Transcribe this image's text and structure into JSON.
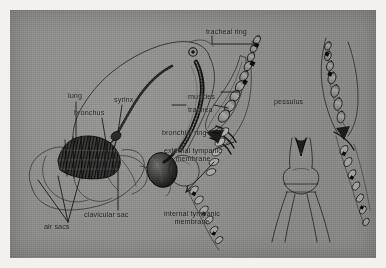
{
  "plate": {
    "background_color": "#8e8e8c",
    "page_color": "#f2f1ee",
    "ink_color": "#19191a",
    "title": "Avian respiratory tract and syrinx"
  },
  "labels": [
    {
      "id": "tracheal-ring",
      "text": "tracheal ring",
      "x": 196,
      "y": 18,
      "align": "left"
    },
    {
      "id": "lung",
      "text": "lung",
      "x": 58,
      "y": 82,
      "align": "left"
    },
    {
      "id": "syrinx",
      "text": "syrinx",
      "x": 104,
      "y": 86,
      "align": "left"
    },
    {
      "id": "bronchus",
      "text": "bronchus",
      "x": 64,
      "y": 99,
      "align": "left"
    },
    {
      "id": "muscles",
      "text": "muscles",
      "x": 178,
      "y": 83,
      "align": "left"
    },
    {
      "id": "trachea",
      "text": "trachea",
      "x": 178,
      "y": 96,
      "align": "left"
    },
    {
      "id": "pessulus",
      "text": "pessulus",
      "x": 264,
      "y": 88,
      "align": "left"
    },
    {
      "id": "bronchial-ring",
      "text": "bronchial ring",
      "x": 152,
      "y": 119,
      "align": "left"
    },
    {
      "id": "external-tympanic-membrane",
      "text": "external tympanic\nmembrane",
      "x": 144,
      "y": 137,
      "align": "center"
    },
    {
      "id": "clavicular-sac",
      "text": "clavicular sac",
      "x": 74,
      "y": 201,
      "align": "left"
    },
    {
      "id": "internal-tympanic-membrane",
      "text": "internal tympanic\nmembrane",
      "x": 142,
      "y": 200,
      "align": "center"
    },
    {
      "id": "air-sacs",
      "text": "air sacs",
      "x": 34,
      "y": 213,
      "align": "left"
    }
  ],
  "figures": [
    {
      "id": "whole-bird-respiratory-tract",
      "caption_parts": [
        "lung",
        "bronchus",
        "syrinx",
        "air sacs",
        "clavicular sac"
      ]
    },
    {
      "id": "syrinx-lateral-view",
      "caption_parts": [
        "tracheal ring",
        "muscles",
        "trachea",
        "bronchial ring",
        "external tympanic membrane"
      ]
    },
    {
      "id": "syrinx-ventral-view",
      "caption_parts": [
        "pessulus"
      ]
    },
    {
      "id": "syrinx-sagittal-view",
      "caption_parts": [
        "internal tympanic membrane"
      ]
    }
  ]
}
